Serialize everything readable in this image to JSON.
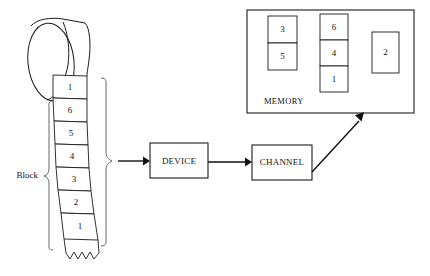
{
  "diagram": {
    "background_color": "#ffffff",
    "line_color": "#1a1a1a"
  },
  "tape": {
    "label": "Block",
    "cells": [
      {
        "value": "1"
      },
      {
        "value": "6"
      },
      {
        "value": "5"
      },
      {
        "value": "4"
      },
      {
        "value": "3"
      },
      {
        "value": "2"
      },
      {
        "value": "1"
      }
    ]
  },
  "flow": {
    "device": {
      "label": "DEVICE"
    },
    "channel": {
      "label": "CHANNEL"
    }
  },
  "memory": {
    "label": "MEMORY",
    "groups": [
      {
        "name": "group-1",
        "cells": [
          "3",
          "5"
        ]
      },
      {
        "name": "group-2",
        "cells": [
          "6",
          "4",
          "1"
        ]
      },
      {
        "name": "group-3",
        "cells": [
          "2"
        ]
      }
    ]
  }
}
